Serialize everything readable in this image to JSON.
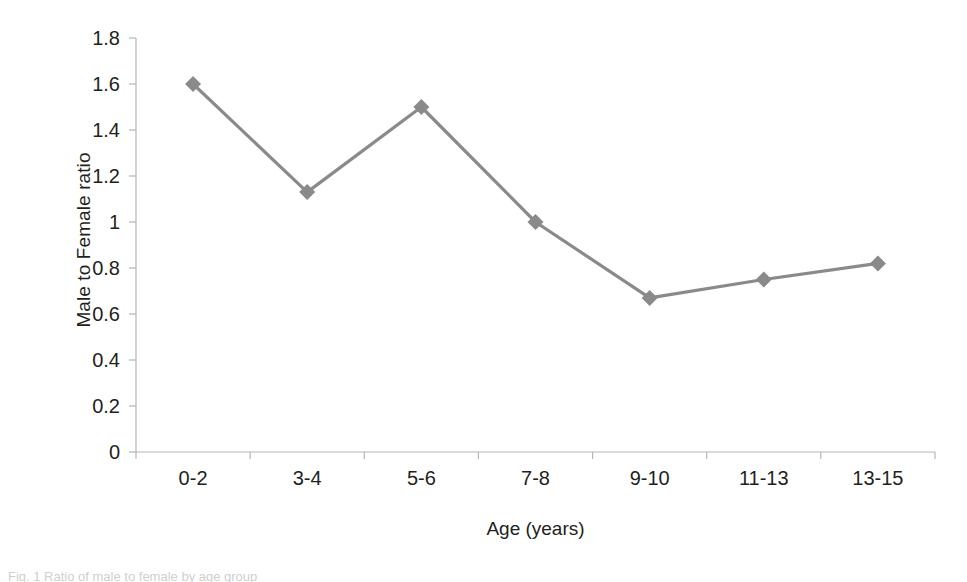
{
  "chart_data": {
    "type": "line",
    "title": "",
    "subtitle": "",
    "xlabel": "Age (years)",
    "ylabel": "Male to Female ratio",
    "categories": [
      "0-2",
      "3-4",
      "5-6",
      "7-8",
      "9-10",
      "11-13",
      "13-15"
    ],
    "values": [
      1.6,
      1.13,
      1.5,
      1.0,
      0.67,
      0.75,
      0.82
    ],
    "series": [
      {
        "name": "Male to Female ratio",
        "values": [
          1.6,
          1.13,
          1.5,
          1.0,
          0.67,
          0.75,
          0.82
        ]
      }
    ],
    "ylim": [
      0,
      1.8
    ],
    "ytick_values": [
      0,
      0.2,
      0.4,
      0.6,
      0.8,
      1.0,
      1.2,
      1.4,
      1.6,
      1.8
    ],
    "ytick_labels": [
      "0",
      "0.2",
      "0.4",
      "0.6",
      "0.8",
      "1",
      "1.2",
      "1.4",
      "1.6",
      "1.8"
    ],
    "grid": false,
    "legend": false,
    "legend_position": "none",
    "marker": "diamond",
    "annotations": []
  },
  "style": {
    "series_color": "#8a8a8a",
    "axis_color": "#b5b5b5",
    "text_color": "#231f20",
    "background": "#ffffff"
  },
  "caption": {
    "text": "Fig. 1 Ratio of male to female by age group"
  }
}
